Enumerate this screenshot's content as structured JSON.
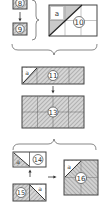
{
  "diagram": {
    "type": "assembly-steps",
    "colors": {
      "line": "#444444",
      "hatch": "#9a9a9a",
      "shade": "#c8c8c8",
      "background": "#ffffff"
    },
    "steps": [
      {
        "id": "8",
        "label": "8"
      },
      {
        "id": "9",
        "label": "9"
      },
      {
        "id": "10",
        "label": "10",
        "corner_label": "a"
      },
      {
        "id": "11",
        "label": "11",
        "corner_label": "a"
      },
      {
        "id": "13",
        "label": "13"
      },
      {
        "id": "14",
        "label": "14",
        "corner_label": "a"
      },
      {
        "id": "15",
        "label": "15",
        "corner_label": "a"
      },
      {
        "id": "16",
        "label": "16",
        "corner_label": "a"
      }
    ],
    "arrows": [
      {
        "from": "8",
        "to": "9",
        "direction": "down"
      },
      {
        "from": "11",
        "to": "13",
        "direction": "down"
      },
      {
        "from": "15",
        "to": "14",
        "direction": "up"
      },
      {
        "from": "14-15",
        "to": "16",
        "direction": "right"
      }
    ]
  }
}
